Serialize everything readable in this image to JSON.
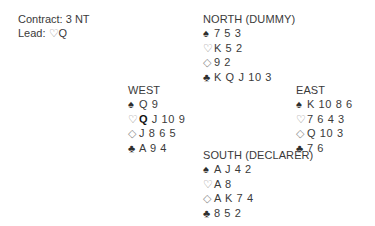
{
  "contract": {
    "contract_label": "Contract:",
    "contract_value": "3 NT",
    "lead_label": "Lead:",
    "lead_suit_symbol": "♡",
    "lead_rank": "Q"
  },
  "symbols": {
    "spade": "♠",
    "heart": "♡",
    "diamond": "◇",
    "club": "♣"
  },
  "hands": {
    "north": {
      "label": "NORTH (DUMMY)",
      "spades": "7 5 3",
      "hearts": "K 5 2",
      "diamonds": "9 2",
      "clubs": "K Q J 10 3"
    },
    "west": {
      "label": "WEST",
      "spades": "Q 9",
      "hearts_lead": "Q",
      "hearts_rest": "J 10 9",
      "diamonds": "J 8 6 5",
      "clubs": "A 9 4"
    },
    "east": {
      "label": "EAST",
      "spades": "K 10 8 6",
      "hearts": "7 6 4 3",
      "diamonds": "Q 10 3",
      "clubs": "7 6"
    },
    "south": {
      "label": "SOUTH (DECLARER)",
      "spades": "A J 4 2",
      "hearts": "A 8",
      "diamonds": "A K 7 4",
      "clubs": "8 5 2"
    }
  }
}
